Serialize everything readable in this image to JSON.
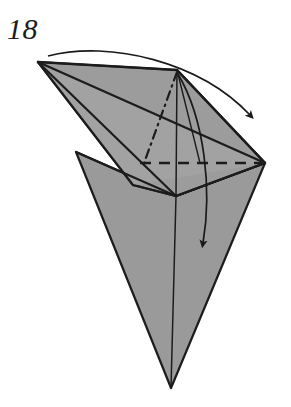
{
  "figure": {
    "kind": "origami-fold-diagram",
    "step_label": "18",
    "caption": "",
    "colors": {
      "paper_fill": "#9a9a9a",
      "paper_fill_light": "#a4a4a4",
      "outline": "#1c1c1c",
      "crease_line": "#242424",
      "arrow": "#1a1a1a",
      "background": "#ffffff"
    },
    "canvas": {
      "width": 291,
      "height": 407
    },
    "shapes": {
      "lower_body": {
        "name": "lower-body-triangle",
        "points": "76,152 176,196 265,163 171,388"
      },
      "lower_left_facet": {
        "name": "lower-left-facet",
        "points": "76,152 176,196 171,388"
      },
      "upper_flap": {
        "name": "upper-left-flap",
        "points": "38,62 177,70 265,163 176,196 133,185"
      },
      "upper_flap_narrow": {
        "name": "upper-flap-narrow-sliver",
        "points": "38,62 265,163 133,185"
      },
      "upper_right_facet": {
        "name": "upper-right-facet",
        "points": "177,70 265,163 176,196"
      }
    },
    "creases": {
      "valley_dashed": {
        "name": "valley-fold-dashed",
        "from": [
          140,
          163
        ],
        "to": [
          263,
          163
        ],
        "style": "dashed"
      },
      "mountain_dashdot": {
        "name": "mountain-fold-dash-dot",
        "from": [
          177,
          72
        ],
        "to": [
          143,
          166
        ],
        "style": "dash-dot"
      },
      "center_vertical": {
        "name": "center-vertical-crease",
        "from": [
          176,
          196
        ],
        "to": [
          171,
          388
        ],
        "style": "solid"
      },
      "apex_vertical": {
        "name": "apex-vertical-crease",
        "from": [
          177,
          70
        ],
        "to": [
          176,
          196
        ],
        "style": "solid"
      },
      "apex_to_right": {
        "name": "apex-to-right-edge-crease",
        "from": [
          177,
          70
        ],
        "to": [
          200,
          163
        ],
        "style": "solid"
      },
      "left_to_right_long": {
        "name": "left-vertex-to-right-vertex-crease",
        "from": [
          38,
          62
        ],
        "to": [
          265,
          163
        ],
        "style": "solid"
      },
      "left_to_center": {
        "name": "left-vertex-to-center-crease",
        "from": [
          38,
          62
        ],
        "to": [
          176,
          196
        ],
        "style": "solid"
      },
      "leftbody_to_center": {
        "name": "left-body-to-center-crease",
        "from": [
          76,
          152
        ],
        "to": [
          176,
          196
        ],
        "style": "solid"
      },
      "center_to_right": {
        "name": "center-to-right-vertex-crease",
        "from": [
          176,
          196
        ],
        "to": [
          265,
          163
        ],
        "style": "solid"
      }
    },
    "arrows": [
      {
        "name": "top-fold-arrow",
        "description": "curved arrow from left tip over the top to the right, indicating the upper flap folds to the right",
        "path": "M 48,56 C 110,40 200,62 250,115",
        "head": {
          "x": 258,
          "y": 133,
          "angle": 58
        }
      },
      {
        "name": "lower-fold-arrow",
        "description": "curved arrow from the top apex down to the lower body, indicating the flap folds downward",
        "path": "M 178,74 C 205,120 212,190 203,243",
        "head": {
          "x": 201,
          "y": 258,
          "angle": 96
        }
      }
    ]
  }
}
